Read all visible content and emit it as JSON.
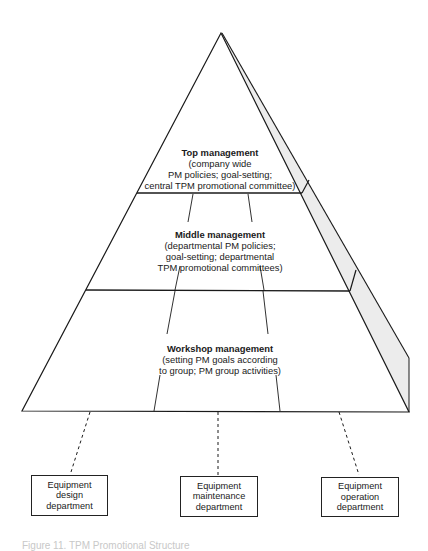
{
  "diagram": {
    "type": "pyramid",
    "tiers": [
      {
        "title": "Top management",
        "description": "(company wide\nPM policies; goal-setting;\ncentral TPM promotional committee)"
      },
      {
        "title": "Middle management",
        "description": "(departmental PM policies;\ngoal-setting; departmental\nTPM promotional committees)"
      },
      {
        "title": "Workshop management",
        "description": "(setting PM goals according\nto group; PM group activities)"
      }
    ],
    "departments": [
      {
        "label": "Equipment\ndesign\ndepartment"
      },
      {
        "label": "Equipment\nmaintenance\ndepartment"
      },
      {
        "label": "Equipment\noperation\ndepartment"
      }
    ],
    "caption": "Figure 11. TPM Promotional Structure",
    "colors": {
      "line": "#1a1a1a",
      "side_face": "#ececec"
    }
  }
}
